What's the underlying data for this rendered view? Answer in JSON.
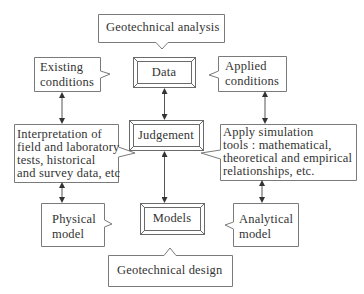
{
  "diagram": {
    "top_callout": {
      "label": "Geotechnical analysis"
    },
    "bottom_callout": {
      "label": "Geotechnical design"
    },
    "central_column": [
      {
        "id": "data",
        "label": "Data"
      },
      {
        "id": "judgement",
        "label": "Judgement"
      },
      {
        "id": "models",
        "label": "Models"
      }
    ],
    "left_column": [
      {
        "id": "existing_conditions",
        "lines": [
          "Existing",
          "conditions"
        ]
      },
      {
        "id": "interpretation",
        "lines": [
          "Interpretation of",
          "field and laboratory",
          "tests, historical",
          "and survey data, etc"
        ]
      },
      {
        "id": "physical_model",
        "lines": [
          "Physical",
          "model"
        ]
      }
    ],
    "right_column": [
      {
        "id": "applied_conditions",
        "lines": [
          "Applied",
          "conditions"
        ]
      },
      {
        "id": "apply_simulation",
        "lines": [
          "Apply simulation",
          "tools : mathematical,",
          "theoretical and empirical",
          "relationships, etc."
        ]
      },
      {
        "id": "analytical_model",
        "lines": [
          "Analytical",
          "model"
        ]
      }
    ],
    "connections": [
      {
        "from": "existing_conditions",
        "to": "interpretation",
        "type": "bidirectional"
      },
      {
        "from": "interpretation",
        "to": "physical_model",
        "type": "bidirectional"
      },
      {
        "from": "data",
        "to": "judgement",
        "type": "bidirectional"
      },
      {
        "from": "judgement",
        "to": "models",
        "type": "bidirectional"
      },
      {
        "from": "applied_conditions",
        "to": "apply_simulation",
        "type": "bidirectional"
      },
      {
        "from": "apply_simulation",
        "to": "analytical_model",
        "type": "bidirectional"
      }
    ],
    "colors": {
      "line": "#7a7a7a",
      "text": "#333333",
      "background": "#ffffff"
    }
  }
}
